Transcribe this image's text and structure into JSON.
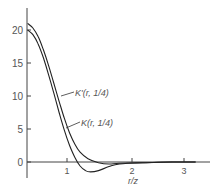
{
  "chart_data": {
    "type": "line",
    "title": "",
    "xlabel": "r/z",
    "ylabel": "",
    "xlim": [
      0.25,
      3.45
    ],
    "ylim": [
      -2.5,
      22
    ],
    "grid": false,
    "x_ticks": [
      "1",
      "2",
      "3"
    ],
    "y_ticks": [
      "0",
      "5",
      "10",
      "15",
      "20"
    ],
    "series": [
      {
        "name": "K'(r, 1/4)",
        "x": [
          0.25,
          0.35,
          0.45,
          0.55,
          0.65,
          0.75,
          0.85,
          0.95,
          1.05,
          1.15,
          1.25,
          1.4,
          1.6,
          1.8,
          2.0,
          2.5,
          3.0,
          3.45
        ],
        "values": [
          21.0,
          20.3,
          19.0,
          17.0,
          14.6,
          11.9,
          9.2,
          6.6,
          4.4,
          2.7,
          1.5,
          0.5,
          -0.1,
          -0.3,
          -0.2,
          -0.1,
          0.0,
          0.0
        ]
      },
      {
        "name": "K(r, 1/4)",
        "x": [
          0.25,
          0.35,
          0.45,
          0.55,
          0.65,
          0.75,
          0.85,
          0.95,
          1.05,
          1.15,
          1.25,
          1.35,
          1.45,
          1.6,
          1.8,
          2.0,
          2.5,
          3.0,
          3.45
        ],
        "values": [
          20.0,
          19.3,
          17.9,
          15.8,
          13.2,
          10.4,
          7.5,
          4.8,
          2.5,
          0.7,
          -0.6,
          -1.3,
          -1.5,
          -1.3,
          -0.7,
          -0.3,
          -0.1,
          0.0,
          0.0
        ]
      }
    ],
    "annotations": [
      {
        "text": "K'(r, 1/4)",
        "points_to": "K'(r, 1/4)"
      },
      {
        "text": "K(r, 1/4)",
        "points_to": "K(r, 1/4)"
      }
    ]
  },
  "labels": {
    "xlabel": "r/z",
    "kprime": "K'(r, 1/4)",
    "k": "K(r, 1/4)",
    "y0": "0",
    "y5": "5",
    "y10": "10",
    "y15": "15",
    "y20": "20",
    "x1": "1",
    "x2": "2",
    "x3": "3"
  }
}
